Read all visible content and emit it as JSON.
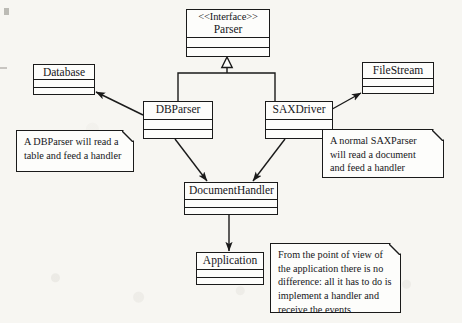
{
  "diagram": {
    "background_color": "#f7f6f2",
    "line_color": "#1a1a1a",
    "box_fill": "#fdfdfb"
  },
  "classes": [
    {
      "id": "parser",
      "stereotype": "<<Interface>>",
      "name": "Parser",
      "x": 186,
      "y": 9,
      "w": 84,
      "h": 48,
      "name_h": 28
    },
    {
      "id": "database",
      "stereotype": "",
      "name": "Database",
      "x": 33,
      "y": 64,
      "w": 62,
      "h": 31,
      "name_h": 15
    },
    {
      "id": "filestream",
      "stereotype": "",
      "name": "FileStream",
      "x": 362,
      "y": 62,
      "w": 72,
      "h": 32,
      "name_h": 16
    },
    {
      "id": "dbparser",
      "stereotype": "",
      "name": "DBParser",
      "x": 143,
      "y": 101,
      "w": 70,
      "h": 38,
      "name_h": 18
    },
    {
      "id": "saxdriver",
      "stereotype": "",
      "name": "SAXDriver",
      "x": 265,
      "y": 101,
      "w": 68,
      "h": 38,
      "name_h": 18
    },
    {
      "id": "documenthandler",
      "stereotype": "",
      "name": "DocumentHandler",
      "x": 184,
      "y": 182,
      "w": 94,
      "h": 33,
      "name_h": 17
    },
    {
      "id": "application",
      "stereotype": "",
      "name": "Application",
      "x": 196,
      "y": 252,
      "w": 68,
      "h": 33,
      "name_h": 17
    }
  ],
  "notes": [
    {
      "id": "note-dbparser",
      "x": 16,
      "y": 130,
      "w": 118,
      "h": 42,
      "lines": [
        "A DBParser will read a",
        "table and feed a handler"
      ]
    },
    {
      "id": "note-saxparser",
      "x": 322,
      "y": 129,
      "w": 122,
      "h": 49,
      "lines": [
        "A normal SAXParser",
        "will read a document",
        "and feed a handler"
      ]
    },
    {
      "id": "note-application",
      "x": 270,
      "y": 243,
      "w": 131,
      "h": 70,
      "lines": [
        "From the point of view of",
        "the application there is no",
        "difference: all it has to do is",
        "implement a handler and",
        "receive the events"
      ]
    }
  ],
  "relationships": [
    {
      "id": "rel-dbparser-realizes-parser",
      "type": "realization",
      "from": "dbparser",
      "to": "parser",
      "arrowhead": "hollow-triangle"
    },
    {
      "id": "rel-saxdriver-realizes-parser",
      "type": "realization",
      "from": "saxdriver",
      "to": "parser",
      "arrowhead": "hollow-triangle"
    },
    {
      "id": "rel-dbparser-uses-database",
      "type": "association",
      "from": "dbparser",
      "to": "database",
      "arrowhead": "solid"
    },
    {
      "id": "rel-saxdriver-uses-filestream",
      "type": "association",
      "from": "saxdriver",
      "to": "filestream",
      "arrowhead": "solid"
    },
    {
      "id": "rel-dbparser-feeds-documenthandler",
      "type": "association",
      "from": "dbparser",
      "to": "documenthandler",
      "arrowhead": "solid"
    },
    {
      "id": "rel-saxdriver-feeds-documenthandler",
      "type": "association",
      "from": "saxdriver",
      "to": "documenthandler",
      "arrowhead": "solid"
    },
    {
      "id": "rel-documenthandler-application",
      "type": "association",
      "from": "documenthandler",
      "to": "application",
      "arrowhead": "solid"
    }
  ]
}
